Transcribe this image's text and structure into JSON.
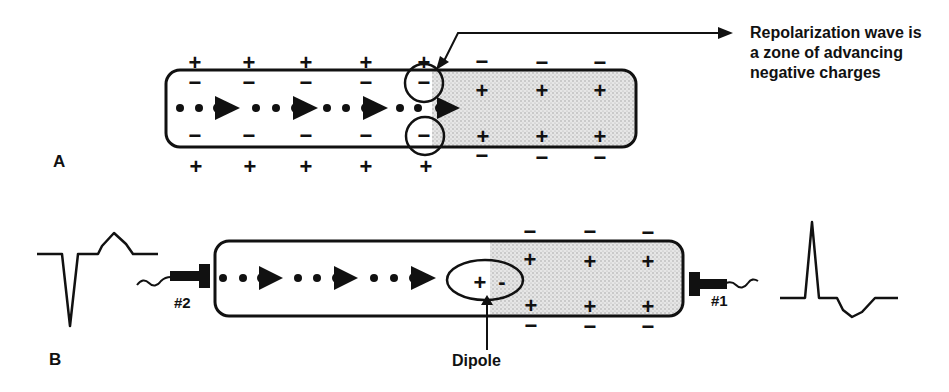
{
  "annotation": {
    "lines": [
      "Repolarization wave is",
      "a zone of advancing",
      "negative charges"
    ]
  },
  "panels": {
    "a": {
      "label": "A",
      "outside_top_left": [
        "+",
        "+",
        "+",
        "+",
        "+"
      ],
      "inside_top_left": [
        "−",
        "−",
        "−",
        "−",
        "−"
      ],
      "inside_bottom_left": [
        "−",
        "−",
        "−",
        "−",
        "−"
      ],
      "outside_bottom_left": [
        "+",
        "+",
        "+",
        "+",
        "+"
      ],
      "outside_top_right": [
        "−",
        "−",
        "−"
      ],
      "inside_top_right": [
        "+",
        "+",
        "+"
      ],
      "inside_bottom_right": [
        "+",
        "+",
        "+"
      ],
      "outside_bottom_right": [
        "−",
        "−",
        "−"
      ]
    },
    "b": {
      "label": "B",
      "electrode_left": "#2",
      "electrode_right": "#1",
      "dipole_label": "Dipole",
      "dipole_plus": "+",
      "dipole_minus": "-",
      "outside_top_right": [
        "−",
        "−",
        "−"
      ],
      "inside_top_right": [
        "+",
        "+",
        "+"
      ],
      "inside_bottom_right": [
        "+",
        "+",
        "+"
      ],
      "outside_bottom_right": [
        "−",
        "−",
        "−"
      ]
    }
  },
  "waveforms": {
    "left": "negative-deflection-with-upright-t-wave",
    "right": "positive-deflection-with-inverted-t-wave"
  },
  "colors": {
    "ink": "#111111",
    "shade": "#d9d9d9",
    "background": "#ffffff"
  }
}
